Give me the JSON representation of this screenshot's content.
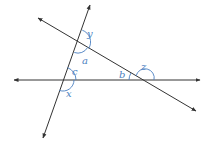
{
  "diagram": {
    "type": "geometry-angles",
    "colors": {
      "line": "#333333",
      "arc": "#4a7fc1",
      "label": "#4a7fc1",
      "background": "#ffffff"
    },
    "lines": [
      {
        "id": "steep-line",
        "from": [
          43,
          138
        ],
        "to": [
          90,
          5
        ],
        "arrows": "both"
      },
      {
        "id": "diagonal-line",
        "from": [
          38,
          18
        ],
        "to": [
          196,
          111
        ],
        "arrows": "both"
      },
      {
        "id": "horizontal-line",
        "from": [
          14,
          80
        ],
        "to": [
          200,
          80
        ],
        "arrows": "both"
      }
    ],
    "intersections": {
      "top": [
        78,
        42
      ],
      "left": [
        63,
        80
      ],
      "right": [
        143,
        80
      ]
    },
    "angles": {
      "y": "y",
      "a": "a",
      "c": "c",
      "x": "x",
      "b": "b",
      "z": "z"
    }
  }
}
